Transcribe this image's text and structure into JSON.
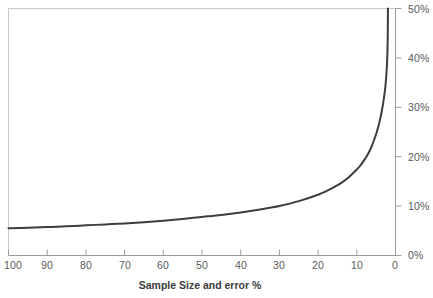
{
  "chart_data": {
    "type": "line",
    "title": "",
    "subtitle": "",
    "xlabel": "Sample Size and error %",
    "ylabel": "",
    "xlim": [
      100,
      0
    ],
    "ylim": [
      0,
      50
    ],
    "x_axis_reversed": true,
    "y_axis_position": "right",
    "grid": false,
    "legend": null,
    "xticks": [
      "100",
      "90",
      "80",
      "70",
      "60",
      "50",
      "40",
      "30",
      "20",
      "10",
      "0"
    ],
    "xtick_values": [
      100,
      90,
      80,
      70,
      60,
      50,
      40,
      30,
      20,
      10,
      0
    ],
    "yticks": [
      "0%",
      "10%",
      "20%",
      "30%",
      "40%",
      "50%"
    ],
    "ytick_values": [
      0,
      10,
      20,
      30,
      40,
      50
    ],
    "series": [
      {
        "name": "Margin of error",
        "color": "#3d3d3d",
        "line_width": 2,
        "x": [
          100,
          95,
          90,
          85,
          80,
          75,
          70,
          65,
          60,
          55,
          50,
          45,
          40,
          35,
          30,
          25,
          20,
          18,
          16,
          14,
          12,
          10,
          9,
          8,
          7,
          6,
          5,
          4.5,
          4,
          3.5,
          3,
          2.6,
          2.3,
          2.1,
          2.0,
          1.95
        ],
        "values": [
          5.5,
          5.6,
          5.75,
          5.9,
          6.1,
          6.3,
          6.5,
          6.75,
          7.05,
          7.4,
          7.8,
          8.2,
          8.7,
          9.3,
          10.0,
          11.0,
          12.3,
          13.0,
          13.8,
          14.7,
          15.9,
          17.4,
          18.3,
          19.4,
          20.7,
          22.4,
          24.6,
          25.9,
          27.5,
          29.4,
          31.8,
          34.3,
          37.3,
          40.7,
          45.0,
          50.0
        ]
      }
    ],
    "annotations": []
  },
  "colors": {
    "curve": "#3d3d3d",
    "axis": "#9c9c9c",
    "plot_border": "#c8c8c8",
    "tick_label": "#595959",
    "axis_title": "#3b3b3b",
    "background": "#ffffff"
  }
}
